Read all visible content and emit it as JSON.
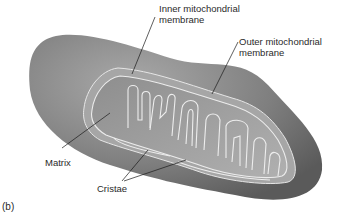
{
  "figure": {
    "panel": "(b)",
    "labels": {
      "inner_membrane_line1": "Inner mitochondrial",
      "inner_membrane_line2": "membrane",
      "outer_membrane_line1": "Outer mitochondrial",
      "outer_membrane_line2": "membrane",
      "matrix": "Matrix",
      "cristae": "Cristae"
    },
    "colors": {
      "outer_body": "#8a8a8a",
      "outer_body_dark": "#5e5e5e",
      "intermembrane": "#a8a8a8",
      "matrix": "#9a9a9a",
      "membrane_line": "#e8e8e8",
      "leader_line": "#1a1a1a",
      "text": "#2a2a2a"
    }
  }
}
